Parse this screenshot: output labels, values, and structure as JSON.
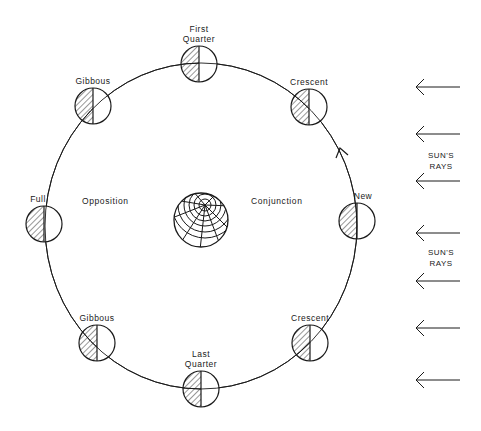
{
  "diagram": {
    "stroke_color": "#1a1a1a",
    "background": "#ffffff",
    "orbit": {
      "cx": 201,
      "cy": 226,
      "rx": 156,
      "ry": 163,
      "direction": "counterclockwise"
    },
    "earth": {
      "cx": 201,
      "cy": 220,
      "r": 27
    },
    "regions": {
      "opposition": "Opposition",
      "conjunction": "Conjunction"
    },
    "phases": [
      {
        "id": "first-quarter",
        "label_line1": "First",
        "label_line2": "Quarter",
        "cx": 199,
        "cy": 64
      },
      {
        "id": "crescent-upper",
        "label_line1": "Crescent",
        "label_line2": "",
        "cx": 309,
        "cy": 107
      },
      {
        "id": "new",
        "label_line1": "New",
        "label_line2": "",
        "cx": 357,
        "cy": 221
      },
      {
        "id": "crescent-lower",
        "label_line1": "Crescent",
        "label_line2": "",
        "cx": 310,
        "cy": 343
      },
      {
        "id": "last-quarter",
        "label_line1": "Last",
        "label_line2": "Quarter",
        "cx": 201,
        "cy": 389
      },
      {
        "id": "gibbous-lower",
        "label_line1": "Gibbous",
        "label_line2": "",
        "cx": 97,
        "cy": 343
      },
      {
        "id": "full",
        "label_line1": "Full",
        "label_line2": "",
        "cx": 44,
        "cy": 224
      },
      {
        "id": "gibbous-upper",
        "label_line1": "Gibbous",
        "label_line2": "",
        "cx": 93,
        "cy": 106
      }
    ],
    "moon_radius": 18,
    "sun_rays": {
      "label_line1": "SUN'S",
      "label_line2": "RAYS",
      "arrow_y": [
        87,
        134,
        181,
        233,
        281,
        328,
        380
      ],
      "arrow_x_start": 460,
      "arrow_x_end": 416
    }
  }
}
